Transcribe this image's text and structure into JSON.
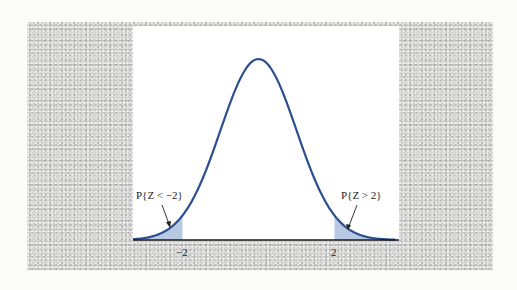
{
  "figure": {
    "colors": {
      "curve": "#2e4f8f",
      "tail_fill": "#b8c9e3",
      "background_panel": "#cdcdcb",
      "plot_area": "#ffffff",
      "axis": "#1a1a1a"
    }
  },
  "annotations": {
    "left_tail_label": "P{Z < −2}",
    "right_tail_label": "P{Z > 2}"
  },
  "axis": {
    "tick_labels": [
      "−2",
      "2"
    ]
  },
  "chart_data": {
    "type": "area",
    "title": "",
    "distribution": "standard normal",
    "mean": 0,
    "sd": 1,
    "x_ticks": [
      -2,
      2
    ],
    "x_tick_labels": [
      "−2",
      "2"
    ],
    "shaded_regions": [
      {
        "from": "-inf",
        "to": -2,
        "label": "P{Z < −2}"
      },
      {
        "from": 2,
        "to": "inf",
        "label": "P{Z > 2}"
      }
    ],
    "xlim": [
      -3.3,
      3.6
    ],
    "grid": false,
    "legend": null
  }
}
